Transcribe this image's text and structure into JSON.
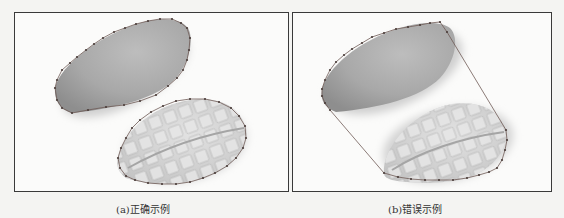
{
  "figure": {
    "panels": [
      {
        "id": "a",
        "caption": "(a)正确示例",
        "description": "Two mango halves (skin and diced flesh) each outlined tightly by their own polygon of vertex points",
        "annotation": "correct"
      },
      {
        "id": "b",
        "caption": "(b)错误示例",
        "description": "Two mango halves outlined by a single polygon spanning both objects, with long straight edges bridging the gap",
        "annotation": "incorrect"
      }
    ]
  },
  "colors": {
    "frame": "#3a3a3a",
    "outline": "#6f5a55",
    "vertex": "#4a3d3a",
    "skin": "#a9a9a9",
    "flesh": "#d6d6d6",
    "background": "#f4f4f2"
  }
}
